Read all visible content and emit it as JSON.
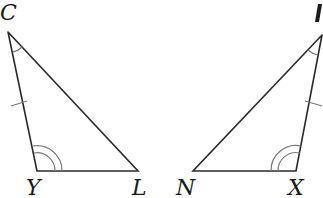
{
  "diagram": {
    "type": "congruent-triangles",
    "triangles": [
      {
        "name": "triangle-CYL",
        "vertices": [
          {
            "label": "C",
            "x": 8,
            "y": 32
          },
          {
            "label": "Y",
            "x": 37,
            "y": 171
          },
          {
            "label": "L",
            "x": 138,
            "y": 171
          }
        ],
        "marks": {
          "single_angle_arc_at": "C",
          "double_angle_arc_at": "Y",
          "tick_mark_on_side": "CY"
        }
      },
      {
        "name": "triangle-right",
        "vertices": [
          {
            "label": "",
            "x": 322,
            "y": 35,
            "note": "label cut off at image edge"
          },
          {
            "label": "N",
            "x": 193,
            "y": 171
          },
          {
            "label": "X",
            "x": 296,
            "y": 171
          }
        ],
        "marks": {
          "single_angle_arc_at": "top",
          "double_angle_arc_at": "X",
          "tick_mark_on_side": "top-X"
        }
      }
    ],
    "labels": {
      "C": "C",
      "Y": "Y",
      "L": "L",
      "N": "N",
      "X": "X",
      "top_right_partial": ""
    }
  }
}
